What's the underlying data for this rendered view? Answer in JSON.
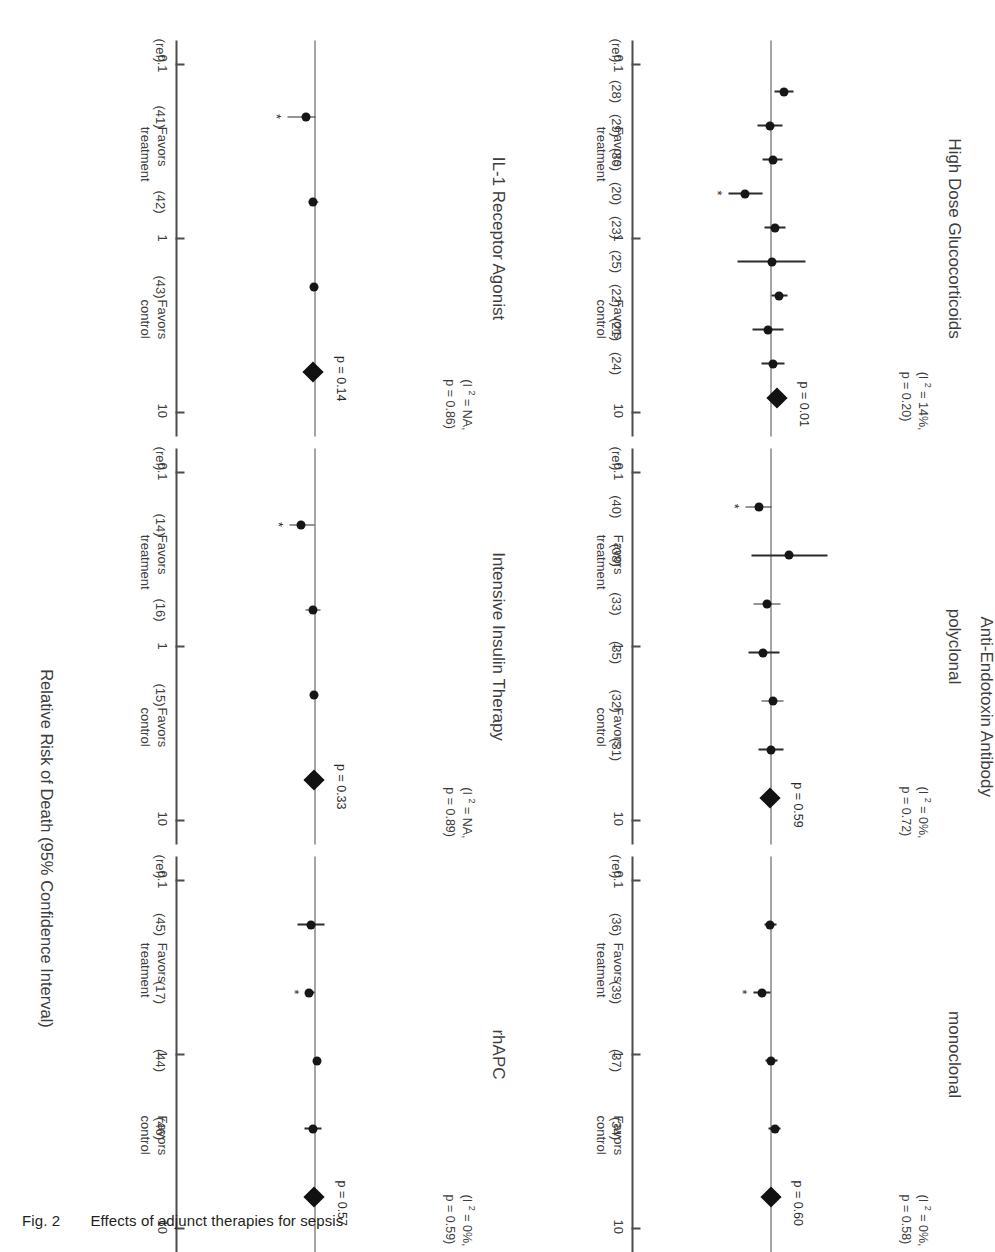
{
  "figure": {
    "number": "Fig. 2",
    "caption": "Effects of adjunct therapies for sepsis",
    "group_header": "Anti-Endotoxin Antibody",
    "xaxis_title": "Relative Risk of Death (95% Confidence Interval)",
    "tick_labels": [
      "0.1",
      "1",
      "10"
    ],
    "favors_treatment": "Favors",
    "favors_treatment2": "treatment",
    "favors_control": "Favors",
    "favors_control2": "control",
    "significance_marker": "*",
    "ref_header": "(ref)",
    "colors": {
      "ink": "#231f20",
      "line": "#4d4d4d",
      "marker": "#161616"
    }
  },
  "chart_data": {
    "type": "scatter",
    "subtype": "forest-plot-grid",
    "title": "Effects of adjunct therapies for sepsis",
    "xlabel": "Relative Risk of Death (95% Confidence Interval)",
    "xscale": "log",
    "xlim": [
      0.1,
      10
    ],
    "xticks": [
      0.1,
      1,
      10
    ],
    "grid": false,
    "null_value": 1,
    "panels": [
      {
        "title": "High Dose Glucocorticoids",
        "i2": "14%",
        "het_p": "0.20",
        "het_text_line1": "(I 2 = 14%,",
        "het_text_line2": "p = 0.20)",
        "pooled_p": "p = 0.01",
        "refs": [
          "(ref)",
          "(28)",
          "(29)",
          "(30)",
          "(20)",
          "(23)",
          "(25)",
          "(22)",
          "(21)",
          "(24)"
        ],
        "studies": [
          {
            "ref": "(28)",
            "rr": 1.62,
            "lo": 1.12,
            "hi": 2.3,
            "significant": false
          },
          {
            "ref": "(29)",
            "rr": 0.95,
            "lo": 0.6,
            "hi": 1.52,
            "significant": false
          },
          {
            "ref": "(30)",
            "rr": 1.04,
            "lo": 0.72,
            "hi": 1.5,
            "significant": false
          },
          {
            "ref": "(20)",
            "rr": 0.38,
            "lo": 0.2,
            "hi": 0.72,
            "significant": true
          },
          {
            "ref": "(23)",
            "rr": 1.16,
            "lo": 0.78,
            "hi": 1.7,
            "significant": false
          },
          {
            "ref": "(25)",
            "rr": 1.02,
            "lo": 0.28,
            "hi": 3.6,
            "significant": false
          },
          {
            "ref": "(22)",
            "rr": 1.32,
            "lo": 1.0,
            "hi": 1.8,
            "significant": false
          },
          {
            "ref": "(21)",
            "rr": 0.88,
            "lo": 0.5,
            "hi": 1.55,
            "significant": false
          },
          {
            "ref": "(24)",
            "rr": 1.06,
            "lo": 0.7,
            "hi": 1.62,
            "significant": false
          }
        ],
        "pooled": {
          "rr": 1.22,
          "lo": 1.05,
          "hi": 1.42
        }
      },
      {
        "title": "polyclonal",
        "i2": "0%",
        "het_p": "0.72",
        "het_text_line1": "(I 2 = 0%,",
        "het_text_line2": "p = 0.72)",
        "pooled_p": "p = 0.59",
        "refs": [
          "(ref)",
          "(40)",
          "(38)",
          "(33)",
          "(35)",
          "(32)",
          "(31)"
        ],
        "studies": [
          {
            "ref": "(40)",
            "rr": 0.62,
            "lo": 0.38,
            "hi": 1.0,
            "significant": true
          },
          {
            "ref": "(38)",
            "rr": 1.95,
            "lo": 0.48,
            "hi": 8.0,
            "significant": false
          },
          {
            "ref": "(33)",
            "rr": 0.85,
            "lo": 0.52,
            "hi": 1.42,
            "significant": false
          },
          {
            "ref": "(35)",
            "rr": 0.72,
            "lo": 0.42,
            "hi": 1.35,
            "significant": false
          },
          {
            "ref": "(32)",
            "rr": 1.05,
            "lo": 0.7,
            "hi": 1.55,
            "significant": false
          },
          {
            "ref": "(31)",
            "rr": 0.98,
            "lo": 0.62,
            "hi": 1.58,
            "significant": false
          }
        ],
        "pooled": {
          "rr": 0.95,
          "lo": 0.8,
          "hi": 1.15
        }
      },
      {
        "title": "monoclonal",
        "i2": "0%",
        "het_p": "0.58",
        "het_text_line1": "(I 2 = 0%,",
        "het_text_line2": "p = 0.58)",
        "pooled_p": "p = 0.60",
        "refs": [
          "(ref)",
          "(36)",
          "(39)",
          "(37)",
          "(34)"
        ],
        "studies": [
          {
            "ref": "(36)",
            "rr": 0.96,
            "lo": 0.76,
            "hi": 1.22,
            "significant": false
          },
          {
            "ref": "(39)",
            "rr": 0.7,
            "lo": 0.52,
            "hi": 0.98,
            "significant": true
          },
          {
            "ref": "(37)",
            "rr": 1.0,
            "lo": 0.8,
            "hi": 1.25,
            "significant": false
          },
          {
            "ref": "(34)",
            "rr": 1.12,
            "lo": 0.88,
            "hi": 1.42,
            "significant": false
          }
        ],
        "pooled": {
          "rr": 0.97,
          "lo": 0.86,
          "hi": 1.08
        }
      },
      {
        "title": "IL-1 Receptor Agonist",
        "i2": "NA",
        "het_p": "0.86",
        "het_text_line1": "(I 2 = NA,",
        "het_text_line2": "p = 0.86)",
        "pooled_p": "p = 0.14",
        "refs": [
          "(ref)",
          "(41)",
          "(42)",
          "(43)"
        ],
        "studies": [
          {
            "ref": "(41)",
            "rr": 0.7,
            "lo": 0.36,
            "hi": 1.0,
            "significant": true
          },
          {
            "ref": "(42)",
            "rr": 0.92,
            "lo": 0.78,
            "hi": 1.1,
            "significant": false
          },
          {
            "ref": "(43)",
            "rr": 0.93,
            "lo": 0.82,
            "hi": 1.06,
            "significant": false
          }
        ],
        "pooled": {
          "rr": 0.92,
          "lo": 0.83,
          "hi": 1.03
        }
      },
      {
        "title": "Intensive Insulin Therapy",
        "i2": "NA",
        "het_p": "0.89",
        "het_text_line1": "(I 2 = NA,",
        "het_text_line2": "p = 0.89)",
        "pooled_p": "p = 0.33",
        "refs": [
          "(ref)",
          "(14)",
          "(16)",
          "(15)"
        ],
        "studies": [
          {
            "ref": "(14)",
            "rr": 0.58,
            "lo": 0.38,
            "hi": 0.95,
            "significant": true
          },
          {
            "ref": "(16)",
            "rr": 0.92,
            "lo": 0.7,
            "hi": 1.22,
            "significant": false
          },
          {
            "ref": "(15)",
            "rr": 0.96,
            "lo": 0.88,
            "hi": 1.06,
            "significant": false
          }
        ],
        "pooled": {
          "rr": 0.94,
          "lo": 0.84,
          "hi": 1.06
        }
      },
      {
        "title": "rhAPC",
        "i2": "0%",
        "het_p": "0.59",
        "het_text_line1": "(I 2 = 0%,",
        "het_text_line2": "p = 0.59)",
        "pooled_p": "p = 0.57",
        "refs": [
          "(ref)",
          "(45)",
          "(17)",
          "(44)",
          "(46)"
        ],
        "studies": [
          {
            "ref": "(45)",
            "rr": 0.84,
            "lo": 0.52,
            "hi": 1.38,
            "significant": false
          },
          {
            "ref": "(17)",
            "rr": 0.8,
            "lo": 0.68,
            "hi": 0.95,
            "significant": true
          },
          {
            "ref": "(44)",
            "rr": 1.04,
            "lo": 0.92,
            "hi": 1.18,
            "significant": false
          },
          {
            "ref": "(46)",
            "rr": 0.9,
            "lo": 0.66,
            "hi": 1.24,
            "significant": false
          }
        ],
        "pooled": {
          "rr": 0.96,
          "lo": 0.86,
          "hi": 1.07
        }
      }
    ]
  }
}
